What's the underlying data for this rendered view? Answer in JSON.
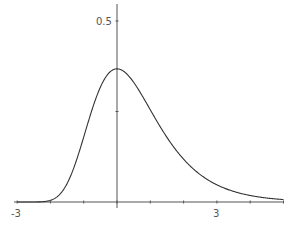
{
  "chart_data": {
    "type": "line",
    "title": "",
    "xlabel": "",
    "ylabel": "",
    "xlim": [
      -3,
      5
    ],
    "ylim": [
      0,
      0.55
    ],
    "grid": false,
    "legend": null,
    "x_ticks": [
      -3,
      -2,
      -1,
      0,
      1,
      2,
      3,
      4,
      5
    ],
    "x_tick_labels": [
      {
        "value": -3,
        "label": "-3"
      },
      {
        "value": 3,
        "label": "3"
      }
    ],
    "y_ticks": [
      0.25,
      0.5
    ],
    "y_tick_labels": [
      {
        "value": 0.5,
        "label": "0.5"
      }
    ],
    "series": [
      {
        "name": "density",
        "color": "#333333",
        "x": [
          -3,
          -2.5,
          -2,
          -1.5,
          -1,
          -0.5,
          0,
          0.5,
          1,
          1.5,
          2,
          2.5,
          3,
          3.5,
          4,
          4.5,
          5
        ],
        "y": [
          0.0,
          0.0,
          0.0046,
          0.05,
          0.1794,
          0.317,
          0.3679,
          0.3325,
          0.2546,
          0.1785,
          0.1182,
          0.0756,
          0.0474,
          0.0294,
          0.018,
          0.011,
          0.0067
        ]
      }
    ]
  },
  "labels": {
    "x_min": "-3",
    "x_mid": "3",
    "y_top": "0.5"
  }
}
